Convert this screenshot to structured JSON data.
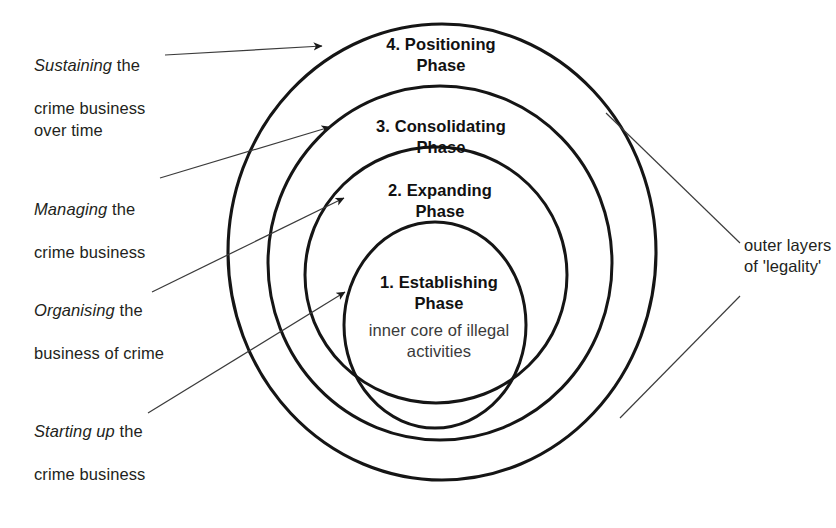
{
  "diagram": {
    "stroke_color": "#151515",
    "leader_color": "#3b3b3b",
    "text_color": "#231f20",
    "core_text_color": "#3a3a3a",
    "rings": [
      {
        "id": "ring-4",
        "index": 4,
        "label_line1": "4. Positioning",
        "label_line2": "Phase",
        "cx": 442,
        "cy": 252,
        "rx": 214,
        "ry": 228
      },
      {
        "id": "ring-3",
        "index": 3,
        "label_line1": "3. Consolidating",
        "label_line2": "Phase",
        "cx": 440,
        "cy": 263,
        "rx": 172,
        "ry": 177
      },
      {
        "id": "ring-2",
        "index": 2,
        "label_line1": "2. Expanding",
        "label_line2": "Phase",
        "cx": 436,
        "cy": 275,
        "rx": 131,
        "ry": 128
      },
      {
        "id": "ring-1",
        "index": 1,
        "label_line1": "1. Establishing",
        "label_line2": "Phase",
        "cx": 435,
        "cy": 325,
        "rx": 91,
        "ry": 103
      }
    ],
    "core_caption": "inner core\nof illegal\nactivities",
    "callouts": [
      {
        "id": "callout-sustaining",
        "emphasis": "Sustaining",
        "rest": " the",
        "lines": "crime business\nover time",
        "target_ring": 4
      },
      {
        "id": "callout-managing",
        "emphasis": "Managing",
        "rest": " the",
        "lines": "crime business",
        "target_ring": 3
      },
      {
        "id": "callout-organising",
        "emphasis": "Organising",
        "rest": " the",
        "lines": "business of crime",
        "target_ring": 2
      },
      {
        "id": "callout-starting-up",
        "emphasis": "Starting up",
        "rest": " the",
        "lines": "crime business",
        "target_ring": 1
      }
    ],
    "side_label": {
      "id": "outer-layers-label",
      "text": "outer layers\nof 'legality'"
    }
  }
}
